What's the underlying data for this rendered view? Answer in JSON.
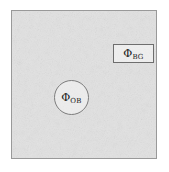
{
  "figure": {
    "kind": "aperture-photometry-diagram",
    "field": {
      "label": "image-field",
      "fill_color": "#e2e2e2",
      "border_color": "#999999",
      "texture": "noise"
    },
    "object_aperture": {
      "symbol": "Φ",
      "subscript": "OB",
      "shape": "circle",
      "border_color": "#7d7d7d"
    },
    "background_region": {
      "symbol": "Φ",
      "subscript": "BG",
      "shape": "rectangle",
      "border_color": "#6e6e6e"
    }
  }
}
